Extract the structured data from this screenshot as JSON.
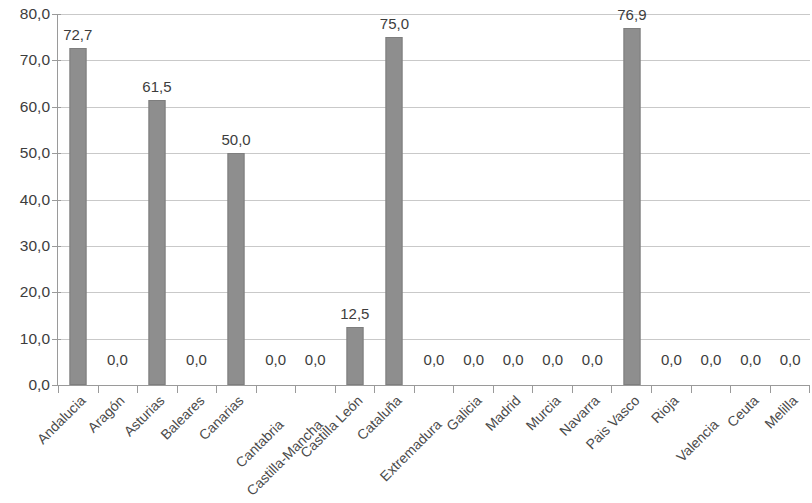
{
  "chart_data": {
    "type": "bar",
    "title": "",
    "subtitle": "",
    "xlabel": "",
    "ylabel": "",
    "ylim": [
      0,
      80
    ],
    "ytick_step": 10,
    "ytick_labels": [
      "0,0",
      "10,0",
      "20,0",
      "30,0",
      "40,0",
      "50,0",
      "60,0",
      "70,0",
      "80,0"
    ],
    "ytick_values": [
      0,
      10,
      20,
      30,
      40,
      50,
      60,
      70,
      80
    ],
    "grid": true,
    "grid_axis": "y",
    "legend": false,
    "legend_position": "none",
    "decimal_separator": ",",
    "bar_color": "#8e8e8e",
    "gridline_color": "#c9c9c9",
    "axis_color": "#9a9a9a",
    "text_color": "#3d3d3d",
    "label_rotation": -45,
    "categories": [
      "Andalucia",
      "Aragón",
      "Asturias",
      "Baleares",
      "Canarias",
      "Cantabria",
      "Castilla-Mancha",
      "Castilla León",
      "Cataluña",
      "Extremadura",
      "Galicia",
      "Madrid",
      "Murcia",
      "Navarra",
      "Pais Vasco",
      "Rioja",
      "Valencia",
      "Ceuta",
      "Melilla"
    ],
    "values": [
      72.7,
      0.0,
      61.5,
      0.0,
      50.0,
      0.0,
      0.0,
      12.5,
      75.0,
      0.0,
      0.0,
      0.0,
      0.0,
      0.0,
      76.9,
      0.0,
      0.0,
      0.0,
      0.0
    ],
    "data_labels": [
      "72,7",
      "0,0",
      "61,5",
      "0,0",
      "50,0",
      "0,0",
      "0,0",
      "12,5",
      "75,0",
      "0,0",
      "0,0",
      "0,0",
      "0,0",
      "0,0",
      "76,9",
      "0,0",
      "0,0",
      "0,0",
      "0,0"
    ],
    "label_stagger": [
      false,
      false,
      false,
      false,
      false,
      true,
      true,
      false,
      false,
      true,
      false,
      false,
      false,
      false,
      false,
      false,
      true,
      false,
      false
    ]
  }
}
